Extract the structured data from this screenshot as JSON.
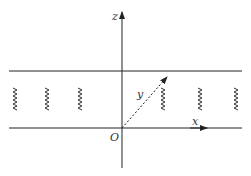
{
  "diagram": {
    "axes": {
      "z_label": "z",
      "x_label": "x",
      "y_label": "y",
      "origin_label": "O"
    },
    "springs": [
      {
        "x": 15
      },
      {
        "x": 47
      },
      {
        "x": 80
      },
      {
        "x": 163
      },
      {
        "x": 200
      },
      {
        "x": 236
      }
    ],
    "colors": {
      "line": "#222222",
      "label": "#333333"
    }
  }
}
